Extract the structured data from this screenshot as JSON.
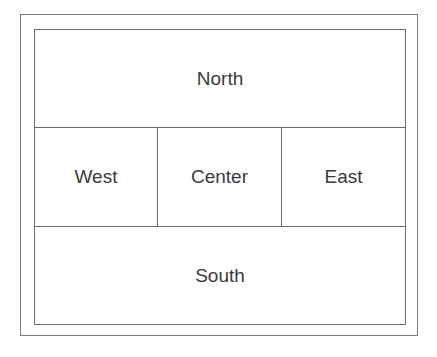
{
  "diagram": {
    "regions": {
      "north": "North",
      "west": "West",
      "center": "Center",
      "east": "East",
      "south": "South"
    },
    "colors": {
      "border": "#6a6a6a",
      "text": "#3a3a3a",
      "background": "#ffffff"
    }
  }
}
